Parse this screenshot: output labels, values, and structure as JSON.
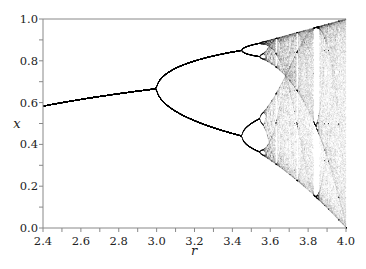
{
  "chart_data": {
    "type": "scatter",
    "title": "",
    "subtitle": "Bifurcation diagram of the logistic map x_{n+1} = r x_n (1 - x_n)",
    "xlabel": "r",
    "ylabel": "x",
    "xlim": [
      2.4,
      4.0
    ],
    "ylim": [
      0.0,
      1.0
    ],
    "xticks": [
      2.4,
      2.6,
      2.8,
      3.0,
      3.2,
      3.4,
      3.6,
      3.8,
      4.0
    ],
    "xtick_labels": [
      "2.4",
      "2.6",
      "2.8",
      "3.0",
      "3.2",
      "3.4",
      "3.6",
      "3.8",
      "4.0"
    ],
    "xminor_step": 0.1,
    "yticks": [
      0.0,
      0.2,
      0.4,
      0.6,
      0.8,
      1.0
    ],
    "ytick_labels": [
      "0.0",
      "0.2",
      "0.4",
      "0.6",
      "0.8",
      "1.0"
    ],
    "yminor_step": 0.1,
    "grid": false,
    "legend": null,
    "series": [
      {
        "name": "logistic map attractor",
        "map": "r*x*(1-x)",
        "r_start": 2.4,
        "r_end": 4.0,
        "r_samples": 900,
        "transient_iterations": 300,
        "plotted_iterations": 160,
        "x0": 0.5,
        "color": "#000000",
        "point_opacity": 0.12
      }
    ],
    "key_points": [
      {
        "r": 2.4,
        "x": [
          0.583
        ]
      },
      {
        "r": 3.0,
        "x": [
          0.667
        ]
      },
      {
        "r": 3.449,
        "x": [
          0.44,
          0.852
        ]
      },
      {
        "r": 3.5699,
        "note": "onset of chaos"
      },
      {
        "r": 3.83,
        "note": "period-3 window"
      },
      {
        "r": 4.0,
        "x_range": [
          0.0,
          1.0
        ]
      }
    ]
  },
  "colors": {
    "background": "#ffffff",
    "axis": "#888888",
    "text": "#222222",
    "points": "#000000"
  }
}
